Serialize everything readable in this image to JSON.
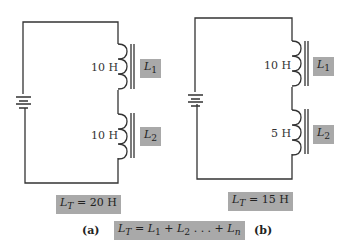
{
  "circuits": [
    {
      "id": "a",
      "caption": "(a)",
      "inductors": [
        {
          "value": "10 H",
          "name": "L",
          "sub": "1"
        },
        {
          "value": "10 H",
          "name": "L",
          "sub": "2"
        }
      ],
      "total": {
        "name": "L",
        "sub": "T",
        "text": " = 20 H"
      }
    },
    {
      "id": "b",
      "caption": "(b)",
      "inductors": [
        {
          "value": "10 H",
          "name": "L",
          "sub": "1"
        },
        {
          "value": "5 H",
          "name": "L",
          "sub": "2"
        }
      ],
      "total": {
        "name": "L",
        "sub": "T",
        "text": " = 15 H"
      }
    }
  ],
  "formula": {
    "lhs": "L",
    "lhs_sub": "T",
    "t1": " = ",
    "l1": "L",
    "s1": "1",
    "t2": " + ",
    "l2": "L",
    "s2": "2",
    "t3": " . . . + ",
    "ln": "L",
    "sn": "n"
  }
}
